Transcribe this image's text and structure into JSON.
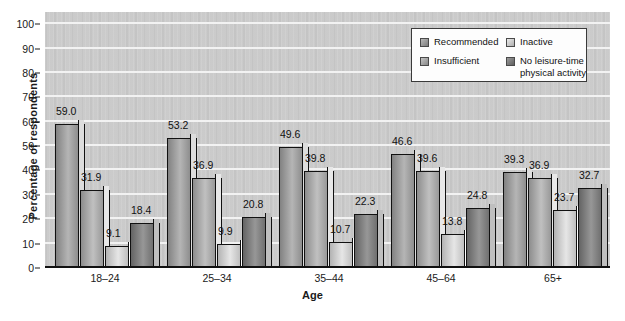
{
  "chart_data": {
    "type": "bar",
    "title": "",
    "xlabel": "Age",
    "ylabel": "Percentage of respondents",
    "ylim": [
      0,
      105
    ],
    "yticks": [
      0,
      10,
      20,
      30,
      40,
      50,
      60,
      70,
      80,
      90,
      100
    ],
    "grid": true,
    "legend_position": "top-right",
    "categories": [
      "18–24",
      "25–34",
      "35–44",
      "45–64",
      "65+"
    ],
    "series": [
      {
        "name": "Recommended",
        "color": "#9b9b9b",
        "values": [
          59.0,
          53.2,
          49.6,
          46.6,
          39.3
        ]
      },
      {
        "name": "Insufficient",
        "color": "#a6a6a6",
        "values": [
          31.9,
          36.9,
          39.8,
          39.6,
          36.9
        ]
      },
      {
        "name": "Inactive",
        "color": "#cccccc",
        "values": [
          9.1,
          9.9,
          10.7,
          13.8,
          23.7
        ]
      },
      {
        "name": "No leisure-time\nphysical activity",
        "color": "#7d7d7d",
        "values": [
          18.4,
          20.8,
          22.3,
          24.8,
          32.7
        ]
      }
    ],
    "data_labels": [
      [
        "59.0",
        "31.9",
        "9.1",
        "18.4"
      ],
      [
        "53.2",
        "36.9",
        "9.9",
        "20.8"
      ],
      [
        "49.6",
        "39.8",
        "10.7",
        "22.3"
      ],
      [
        "46.6",
        "39.6",
        "13.8",
        "24.8"
      ],
      [
        "39.3",
        "36.9",
        "23.7",
        "32.7"
      ]
    ],
    "ytick_labels": [
      "0",
      "10",
      "20",
      "30",
      "40",
      "50",
      "60",
      "70",
      "80",
      "90",
      "100"
    ],
    "plot_background": "#c9c9c9",
    "gridline_color": "#f2f2f2",
    "axis_color": "#111111"
  },
  "legend": {
    "items": [
      {
        "label": "Recommended",
        "color": "#9b9b9b"
      },
      {
        "label": "Inactive",
        "color": "#cccccc"
      },
      {
        "label": "Insufficient",
        "color": "#a6a6a6"
      },
      {
        "label": "No leisure-time\nphysical activity",
        "color": "#7d7d7d"
      }
    ]
  }
}
